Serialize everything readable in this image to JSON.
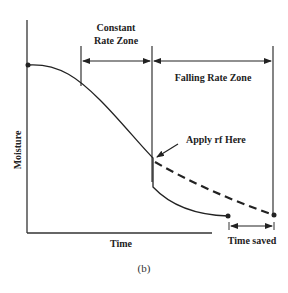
{
  "diagram": {
    "caption": "(b)",
    "axes": {
      "x_label": "Time",
      "y_label": "Moisture"
    },
    "zones": {
      "constant_line1": "Constant",
      "constant_line2": "Rate Zone",
      "falling": "Falling Rate Zone"
    },
    "annotations": {
      "apply_rf": "Apply rf Here",
      "time_saved": "Time saved"
    },
    "curves": [
      {
        "name": "conventional drying",
        "style": "solid"
      },
      {
        "name": "with rf applied",
        "style": "dashed"
      }
    ],
    "colors": {
      "line": "#222222",
      "background": "#ffffff"
    }
  }
}
